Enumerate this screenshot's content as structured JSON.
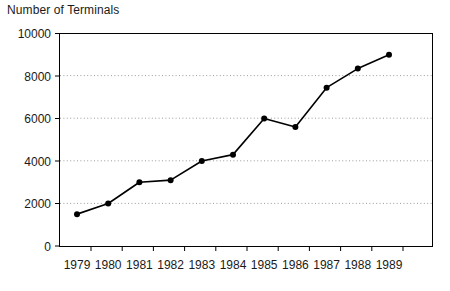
{
  "chart_data": {
    "type": "line",
    "title": "Number of Terminals",
    "xlabel": "",
    "ylabel": "",
    "categories": [
      "1979",
      "1980",
      "1981",
      "1982",
      "1983",
      "1984",
      "1985",
      "1986",
      "1987",
      "1988",
      "1989"
    ],
    "values": [
      1500,
      2000,
      3000,
      3100,
      4000,
      4300,
      6000,
      5600,
      7450,
      8350,
      9000
    ],
    "series": [
      {
        "name": "Number of Terminals",
        "values": [
          1500,
          2000,
          3000,
          3100,
          4000,
          4300,
          6000,
          5600,
          7450,
          8350,
          9000
        ]
      }
    ],
    "ylim": [
      0,
      10000
    ],
    "y_ticks": [
      0,
      2000,
      4000,
      6000,
      8000,
      10000
    ],
    "y_tick_labels": [
      "0",
      "2000",
      "4000",
      "6000",
      "8000",
      "10000"
    ],
    "x_tick_labels": [
      "1979",
      "1980",
      "1981",
      "1982",
      "1983",
      "1984",
      "1985",
      "1986",
      "1987",
      "1988",
      "1989"
    ],
    "grid": "horizontal-dotted",
    "legend": "none",
    "marker": "filled-circle",
    "line_color": "#000000",
    "marker_color": "#000000",
    "grid_color": "#9a9a9a",
    "axis_color": "#000000",
    "background_color": "#ffffff"
  },
  "axis": {
    "y_labels": [
      "10000",
      "8000",
      "6000",
      "4000",
      "2000",
      "0"
    ],
    "x_labels": [
      "1979",
      "1980",
      "1981",
      "1982",
      "1983",
      "1984",
      "1985",
      "1986",
      "1987",
      "1988",
      "1989"
    ]
  }
}
